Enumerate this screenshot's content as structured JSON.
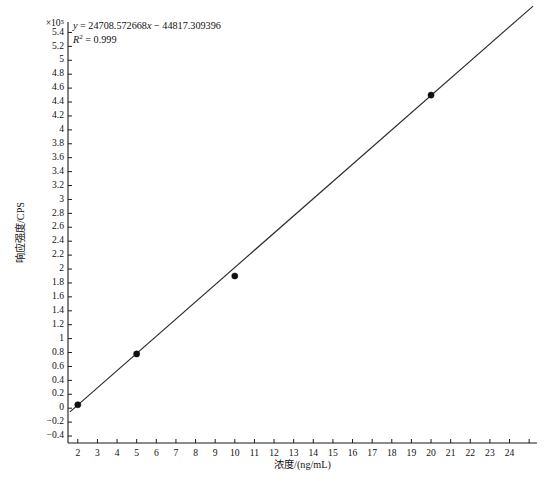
{
  "chart_data": {
    "type": "scatter",
    "title": "",
    "subtitle": "",
    "xlabel": "浓度/(ng/mL)",
    "ylabel": "响应强度/CPS",
    "y_exponent_label": "×10⁵",
    "y_scale_factor": 100000,
    "xlim": [
      1.5,
      25.4
    ],
    "ylim": [
      -0.5,
      5.55
    ],
    "xticks": [
      2,
      3,
      4,
      5,
      6,
      7,
      8,
      9,
      10,
      11,
      12,
      13,
      14,
      15,
      16,
      17,
      18,
      19,
      20,
      21,
      22,
      23,
      24,
      25
    ],
    "xticklabels": [
      "2",
      "3",
      "4",
      "5",
      "6",
      "7",
      "8",
      "9",
      "10",
      "11",
      "12",
      "13",
      "14",
      "15",
      "16",
      "17",
      "18",
      "19",
      "20",
      "21",
      "22",
      "23",
      "24",
      ""
    ],
    "yticks": [
      -0.4,
      -0.2,
      0,
      0.2,
      0.4,
      0.6,
      0.8,
      1,
      1.2,
      1.4,
      1.6,
      1.8,
      2,
      2.2,
      2.4,
      2.6,
      2.8,
      3,
      3.2,
      3.4,
      3.6,
      3.8,
      4,
      4.2,
      4.4,
      4.6,
      4.8,
      5,
      5.2,
      5.4
    ],
    "yticklabels": [
      "−0.4",
      "−0.2",
      "0",
      "0.2",
      "0.4",
      "0.6",
      "0.8",
      "1",
      "1.2",
      "1.4",
      "1.6",
      "1.8",
      "2",
      "2.2",
      "2.4",
      "2.6",
      "2.8",
      "3",
      "3.2",
      "3.4",
      "3.6",
      "3.8",
      "4",
      "4.2",
      "4.4",
      "4.6",
      "4.8",
      "5",
      "5.2",
      "5.4"
    ],
    "grid": false,
    "legend": false,
    "x": [
      2,
      5,
      10,
      20
    ],
    "y": [
      0.05,
      0.78,
      1.9,
      4.5
    ],
    "points": [
      {
        "x": 2,
        "y": 0.05
      },
      {
        "x": 5,
        "y": 0.78
      },
      {
        "x": 10,
        "y": 1.9
      },
      {
        "x": 20,
        "y": 4.5
      }
    ],
    "fit": {
      "slope": 24708.572668,
      "intercept": -44817.309396,
      "r_squared": 0.999,
      "x_start": 1.6,
      "x_end": 25.2
    },
    "annotations": {
      "equation_prefix": "y",
      "equation_eq": " = ",
      "equation_body": "24708.572668",
      "equation_x": "x",
      "equation_tail": " − 44817.309396",
      "equation_full": "y = 24708.572668x − 44817.309396",
      "r2_symbol": "R",
      "r2_sup": "2",
      "r2_value": " = 0.999",
      "r2_full": "R² = 0.999"
    }
  }
}
